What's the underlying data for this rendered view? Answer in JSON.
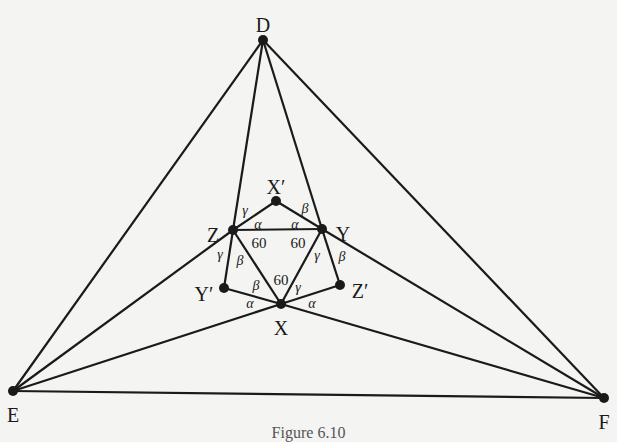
{
  "figure": {
    "caption": "Figure 6.10",
    "colors": {
      "line": "#1a1a1a",
      "background": "#f4f4f2"
    },
    "points": [
      {
        "id": "D",
        "label": "D",
        "x": 263,
        "y": 40,
        "lx": 263,
        "ly": 27
      },
      {
        "id": "E",
        "label": "E",
        "x": 13,
        "y": 391,
        "lx": 13,
        "ly": 417
      },
      {
        "id": "F",
        "label": "F",
        "x": 604,
        "y": 398,
        "lx": 604,
        "ly": 424
      },
      {
        "id": "Z",
        "label": "Z",
        "x": 233,
        "y": 230,
        "lx": 213,
        "ly": 237
      },
      {
        "id": "Y",
        "label": "Y",
        "x": 322,
        "y": 229,
        "lx": 343,
        "ly": 236
      },
      {
        "id": "X",
        "label": "X",
        "x": 281,
        "y": 304,
        "lx": 281,
        "ly": 330
      },
      {
        "id": "Xp",
        "label": "X′",
        "x": 276,
        "y": 201,
        "lx": 276,
        "ly": 189
      },
      {
        "id": "Yp",
        "label": "Y′",
        "x": 224,
        "y": 288,
        "lx": 204,
        "ly": 296
      },
      {
        "id": "Zp",
        "label": "Z′",
        "x": 340,
        "y": 285,
        "lx": 360,
        "ly": 293
      }
    ],
    "segments": [
      [
        "D",
        "E"
      ],
      [
        "D",
        "F"
      ],
      [
        "E",
        "F"
      ],
      [
        "D",
        "Z"
      ],
      [
        "D",
        "Y"
      ],
      [
        "E",
        "Z"
      ],
      [
        "E",
        "X"
      ],
      [
        "F",
        "Y"
      ],
      [
        "F",
        "X"
      ],
      [
        "Z",
        "Xp"
      ],
      [
        "Xp",
        "Y"
      ],
      [
        "Z",
        "Y"
      ],
      [
        "Z",
        "X"
      ],
      [
        "Y",
        "X"
      ],
      [
        "Z",
        "Yp"
      ],
      [
        "Yp",
        "X"
      ],
      [
        "Y",
        "Zp"
      ],
      [
        "Zp",
        "X"
      ]
    ],
    "angle_labels": [
      {
        "text": "γ",
        "x": 245,
        "y": 212
      },
      {
        "text": "α",
        "x": 258,
        "y": 226
      },
      {
        "text": "α",
        "x": 295,
        "y": 226
      },
      {
        "text": "β",
        "x": 305,
        "y": 210
      },
      {
        "text": "60",
        "x": 259,
        "y": 245
      },
      {
        "text": "60",
        "x": 298,
        "y": 245
      },
      {
        "text": "γ",
        "x": 220,
        "y": 256
      },
      {
        "text": "β",
        "x": 240,
        "y": 262
      },
      {
        "text": "γ",
        "x": 317,
        "y": 257
      },
      {
        "text": "β",
        "x": 342,
        "y": 258
      },
      {
        "text": "60",
        "x": 281,
        "y": 282
      },
      {
        "text": "β",
        "x": 256,
        "y": 287
      },
      {
        "text": "γ",
        "x": 298,
        "y": 289
      },
      {
        "text": "α",
        "x": 250,
        "y": 305
      },
      {
        "text": "α",
        "x": 312,
        "y": 305
      }
    ]
  }
}
